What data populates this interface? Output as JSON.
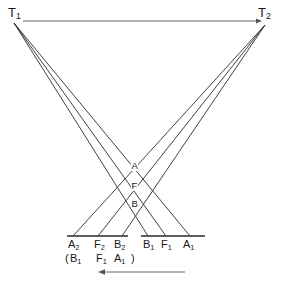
{
  "diagram": {
    "terminals": [
      {
        "id": "T1",
        "label": "T",
        "sub": "1",
        "x": 14,
        "y": 23,
        "label_x": 8,
        "label_y": 6
      },
      {
        "id": "T2",
        "label": "T",
        "sub": "2",
        "x": 265,
        "y": 25,
        "label_x": 258,
        "label_y": 6
      }
    ],
    "top_axis": {
      "name": "top-direction-arrow",
      "from_x": 23,
      "to_x": 262,
      "y": 21,
      "direction": "right",
      "color": "#555555"
    },
    "bottom_axis": {
      "name": "bottom-direction-arrow",
      "from_x": 185,
      "to_x": 98,
      "y": 272,
      "direction": "left",
      "color": "#555555"
    },
    "baseline": {
      "y": 236,
      "segments": [
        {
          "x1": 67,
          "x2": 128
        },
        {
          "x1": 141,
          "x2": 205
        }
      ],
      "color": "#2b2b2b"
    },
    "rays": [
      {
        "name": "ray-T1-to-B1",
        "from": "T1",
        "to_label": "B1",
        "x1": 14,
        "y1": 23,
        "x2": 148,
        "y2": 236
      },
      {
        "name": "ray-T1-to-F1",
        "from": "T1",
        "to_label": "F1",
        "x1": 14,
        "y1": 23,
        "x2": 166,
        "y2": 236
      },
      {
        "name": "ray-T1-to-A1",
        "from": "T1",
        "to_label": "A1",
        "x1": 14,
        "y1": 23,
        "x2": 190,
        "y2": 236
      },
      {
        "name": "ray-T2-to-A2",
        "from": "T2",
        "to_label": "A2",
        "x1": 265,
        "y1": 25,
        "x2": 73,
        "y2": 236
      },
      {
        "name": "ray-T2-to-F2",
        "from": "T2",
        "to_label": "F2",
        "x1": 265,
        "y1": 25,
        "x2": 98,
        "y2": 236
      },
      {
        "name": "ray-T2-to-B2",
        "from": "T2",
        "to_label": "B2",
        "x1": 265,
        "y1": 25,
        "x2": 122,
        "y2": 236
      }
    ],
    "intersection_points": [
      {
        "id": "A",
        "label": "A",
        "x": 131,
        "y": 161
      },
      {
        "id": "F",
        "label": "F",
        "x": 131,
        "y": 181
      },
      {
        "id": "B",
        "label": "B",
        "x": 131,
        "y": 199
      }
    ],
    "base_labels": [
      {
        "id": "A2",
        "label": "A",
        "sub": "2",
        "x": 68,
        "y": 239
      },
      {
        "id": "F2",
        "label": "F",
        "sub": "2",
        "x": 94,
        "y": 239
      },
      {
        "id": "B2",
        "label": "B",
        "sub": "2",
        "x": 114,
        "y": 239
      },
      {
        "id": "B1",
        "label": "B",
        "sub": "1",
        "x": 143,
        "y": 239
      },
      {
        "id": "F1",
        "label": "F",
        "sub": "1",
        "x": 161,
        "y": 239
      },
      {
        "id": "A1",
        "label": "A",
        "sub": "1",
        "x": 183,
        "y": 239
      }
    ],
    "paren_labels": [
      {
        "id": "open-paren",
        "label": "(",
        "sub": "",
        "x": 65,
        "y": 253
      },
      {
        "id": "B1-paren",
        "label": "B",
        "sub": "1",
        "x": 70,
        "y": 253
      },
      {
        "id": "F1-paren",
        "label": "F",
        "sub": "1",
        "x": 96,
        "y": 253
      },
      {
        "id": "A1-paren",
        "label": "A",
        "sub": "1",
        "x": 114,
        "y": 253
      },
      {
        "id": "close-paren",
        "label": ")",
        "sub": "",
        "x": 131,
        "y": 253
      }
    ]
  }
}
